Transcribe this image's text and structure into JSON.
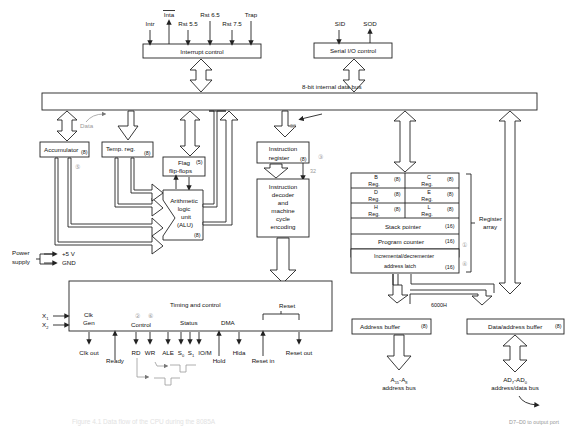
{
  "diagram": {
    "interrupt": {
      "box": "Interrupt control",
      "signals": [
        "Intr",
        "Inta",
        "Rst 5.5",
        "Rst 6.5",
        "Rst 7.5",
        "Trap"
      ]
    },
    "serial": {
      "box": "Serial I/O control",
      "signals": [
        "SID",
        "SOD"
      ]
    },
    "bus_label": "8-bit internal data bus",
    "accumulator": {
      "label": "Accumulator",
      "size": "(8)"
    },
    "temp_reg": {
      "label": "Temp. reg.",
      "size": "(8)"
    },
    "flags": {
      "line1": "Flag",
      "line2": "flip-flops",
      "size": "(5)"
    },
    "alu": {
      "lines": [
        "Arithmetic",
        "logic",
        "unit",
        "(ALU)"
      ],
      "size": "(8)"
    },
    "instr_reg": {
      "line1": "Instruction",
      "line2": "register",
      "size": "(8)"
    },
    "decoder": {
      "lines": [
        "Instruction",
        "decoder",
        "and",
        "machine",
        "cycle",
        "encoding"
      ]
    },
    "registers": {
      "B": {
        "name": "B",
        "sub": "Reg.",
        "size": "(8)"
      },
      "C": {
        "name": "C",
        "sub": "Reg.",
        "size": "(8)"
      },
      "D": {
        "name": "D",
        "sub": "Reg.",
        "size": "(8)"
      },
      "E": {
        "name": "E",
        "sub": "Reg.",
        "size": "(8)"
      },
      "H": {
        "name": "H",
        "sub": "Reg.",
        "size": "(8)"
      },
      "L": {
        "name": "L",
        "sub": "Reg.",
        "size": "(8)"
      },
      "sp": {
        "label": "Stack pointer",
        "size": "(16)"
      },
      "pc": {
        "label": "Program counter",
        "size": "(16)"
      },
      "latch": {
        "line1": "Incremental/decrementer",
        "line2": "address latch",
        "size": "(16)"
      },
      "array_label1": "Register",
      "array_label2": "array"
    },
    "power": {
      "label1": "Power",
      "label2": "supply",
      "v": "+5 V",
      "gnd": "GND"
    },
    "timing": {
      "title": "Timing and control",
      "clk1": "Clk",
      "clk2": "Gen",
      "control": "Control",
      "status": "Status",
      "dma": "DMA",
      "reset": "Reset",
      "x1": "X",
      "x1sub": "1",
      "x2": "X",
      "x2sub": "2",
      "outputs": {
        "clk_out": "Clk out",
        "ready": "Ready",
        "rd": "RD",
        "wr": "WR",
        "ale": "ALE",
        "s0": "S",
        "s0sub": "0",
        "s1": "S",
        "s1sub": "1",
        "iom": "IO/M",
        "hold": "Hold",
        "hlda": "Hlda",
        "reset_in": "Reset in",
        "reset_out": "Reset out"
      }
    },
    "address_buffer": {
      "label": "Address buffer",
      "size": "(8)"
    },
    "data_buffer": {
      "label": "Data/address buffer",
      "size": "(8)"
    },
    "addr_bus": {
      "line1a": "A",
      "line1sub1": "15",
      "line1b": "-A",
      "line1sub2": "8",
      "line2": "address bus"
    },
    "data_bus": {
      "line1a": "AD",
      "line1sub1": "7",
      "line1b": "-AD",
      "line1sub2": "0",
      "line2": "address/data bus"
    },
    "annotations": {
      "data": "Data",
      "n32a": "32",
      "n32b": "32",
      "addr_6000": "6000H",
      "output_port": "D7–D0 to output port",
      "step1": "①",
      "step2": "②",
      "step3": "③",
      "step4": "④",
      "step5": "⑤",
      "step6": "⑥"
    },
    "caption": "Figure 4.1 Data flow of the CPU during the 8085A"
  }
}
